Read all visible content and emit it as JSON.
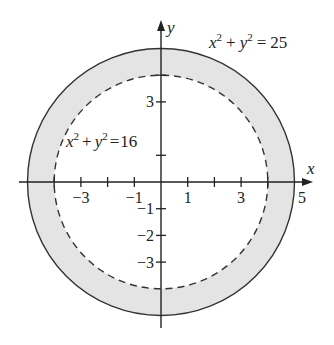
{
  "diagram": {
    "colors": {
      "fill": "#e4e4e4",
      "stroke": "#333333"
    },
    "origin": {
      "px": 161,
      "py": 182
    },
    "unit": 26.7,
    "outer_circle": {
      "radius": 5,
      "equation": {
        "lhs_x": "x",
        "lhs_y": "y",
        "exp": "2",
        "plus": "+",
        "eq": "=",
        "rhs": "25"
      },
      "style": "solid"
    },
    "inner_circle": {
      "radius": 4,
      "equation": {
        "lhs_x": "x",
        "lhs_y": "y",
        "exp": "2",
        "plus": "+",
        "eq": "=",
        "rhs": "16"
      },
      "style": "dashed"
    },
    "axes": {
      "x_label": "x",
      "y_label": "y"
    },
    "x_tick_labels": [
      "−3",
      "−1",
      "1",
      "3",
      "5"
    ],
    "y_tick_labels": [
      "3",
      "−1",
      "−2",
      "−3"
    ]
  }
}
